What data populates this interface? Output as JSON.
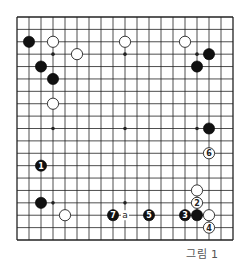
{
  "diagram": {
    "type": "go-board",
    "size": 19,
    "caption": "그림 1",
    "colors": {
      "line": "#222222",
      "black_stone": "#111111",
      "white_stone": "#ffffff",
      "caption": "#555555"
    },
    "star_points": [
      [
        3,
        3
      ],
      [
        9,
        3
      ],
      [
        15,
        3
      ],
      [
        3,
        9
      ],
      [
        9,
        9
      ],
      [
        15,
        9
      ],
      [
        3,
        15
      ],
      [
        9,
        15
      ],
      [
        15,
        15
      ]
    ],
    "stones": [
      {
        "color": "black",
        "col": 1,
        "row": 2,
        "label": ""
      },
      {
        "color": "black",
        "col": 2,
        "row": 4,
        "label": ""
      },
      {
        "color": "black",
        "col": 3,
        "row": 5,
        "label": ""
      },
      {
        "color": "black",
        "col": 16,
        "row": 3,
        "label": ""
      },
      {
        "color": "black",
        "col": 15,
        "row": 4,
        "label": ""
      },
      {
        "color": "black",
        "col": 16,
        "row": 9,
        "label": ""
      },
      {
        "color": "black",
        "col": 2,
        "row": 15,
        "label": ""
      },
      {
        "color": "black",
        "col": 15,
        "row": 16,
        "label": ""
      },
      {
        "color": "black",
        "col": 2,
        "row": 12,
        "label": "1"
      },
      {
        "color": "black",
        "col": 14,
        "row": 16,
        "label": "3"
      },
      {
        "color": "black",
        "col": 11,
        "row": 16,
        "label": "5"
      },
      {
        "color": "black",
        "col": 8,
        "row": 16,
        "label": "7"
      },
      {
        "color": "white",
        "col": 3,
        "row": 2,
        "label": ""
      },
      {
        "color": "white",
        "col": 5,
        "row": 3,
        "label": ""
      },
      {
        "color": "white",
        "col": 3,
        "row": 7,
        "label": ""
      },
      {
        "color": "white",
        "col": 9,
        "row": 2,
        "label": ""
      },
      {
        "color": "white",
        "col": 14,
        "row": 2,
        "label": ""
      },
      {
        "color": "white",
        "col": 4,
        "row": 16,
        "label": ""
      },
      {
        "color": "white",
        "col": 15,
        "row": 14,
        "label": ""
      },
      {
        "color": "white",
        "col": 16,
        "row": 16,
        "label": ""
      },
      {
        "color": "white",
        "col": 15,
        "row": 15,
        "label": "2"
      },
      {
        "color": "white",
        "col": 16,
        "row": 17,
        "label": "4"
      },
      {
        "color": "white",
        "col": 16,
        "row": 11,
        "label": "6"
      }
    ],
    "point_labels": [
      {
        "col": 9,
        "row": 16,
        "text": "a"
      }
    ]
  }
}
